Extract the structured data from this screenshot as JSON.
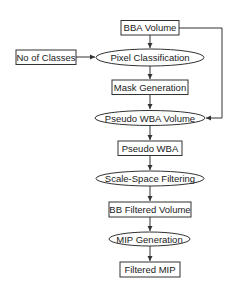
{
  "diagram": {
    "type": "flowchart",
    "colors": {
      "stroke": "#333333",
      "text": "#1a1a1a",
      "background": "#ffffff"
    },
    "nodes": [
      {
        "id": "bba_volume",
        "shape": "rect",
        "label": "BBA Volume"
      },
      {
        "id": "no_of_classes",
        "shape": "rect",
        "label": "No of Classes"
      },
      {
        "id": "pixel_classification",
        "shape": "ellipse",
        "label": "Pixel Classification"
      },
      {
        "id": "mask_generation",
        "shape": "rect",
        "label": "Mask Generation"
      },
      {
        "id": "pseudo_wba_volume",
        "shape": "ellipse",
        "label": "Pseudo WBA Volume"
      },
      {
        "id": "pseudo_wba",
        "shape": "rect",
        "label": "Pseudo WBA"
      },
      {
        "id": "scale_space_filtering",
        "shape": "ellipse",
        "label": "Scale-Space Filtering"
      },
      {
        "id": "bb_filtered_volume",
        "shape": "rect",
        "label": "BB Filtered Volume"
      },
      {
        "id": "mip_generation",
        "shape": "ellipse",
        "label": "MIP Generation"
      },
      {
        "id": "filtered_mip",
        "shape": "rect",
        "label": "Filtered MIP"
      }
    ],
    "edges": [
      {
        "from": "bba_volume",
        "to": "pixel_classification"
      },
      {
        "from": "no_of_classes",
        "to": "pixel_classification"
      },
      {
        "from": "pixel_classification",
        "to": "mask_generation"
      },
      {
        "from": "mask_generation",
        "to": "pseudo_wba_volume"
      },
      {
        "from": "bba_volume",
        "to": "pseudo_wba_volume",
        "route": "right-side"
      },
      {
        "from": "pseudo_wba_volume",
        "to": "pseudo_wba"
      },
      {
        "from": "pseudo_wba",
        "to": "scale_space_filtering"
      },
      {
        "from": "scale_space_filtering",
        "to": "bb_filtered_volume"
      },
      {
        "from": "bb_filtered_volume",
        "to": "mip_generation"
      },
      {
        "from": "mip_generation",
        "to": "filtered_mip"
      }
    ]
  }
}
